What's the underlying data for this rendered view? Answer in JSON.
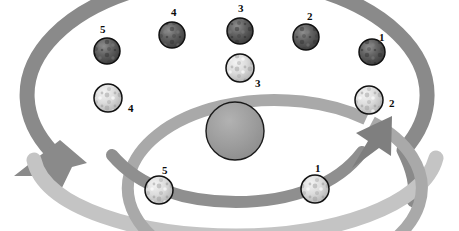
{
  "figure": {
    "title": "",
    "top_cropped_text": "",
    "center_body": {
      "name": "planet",
      "fill": "#9a9a9a",
      "stroke": "#1a1a1a"
    }
  },
  "palette": {
    "outer_arrow": "#8a8a8a",
    "inner_arrow": "#a9a9a9",
    "lower_pale_arc": "#c4c4c4",
    "dark_moon_fill": "#5d5d5d",
    "light_moon_fill": "#d8d8d8",
    "moon_stroke": "#111111",
    "label_color": "#0b0b0b",
    "background": "#ffffff"
  },
  "orbits": [
    {
      "id": "outer-orbit",
      "name": "outer-orbit-arrow",
      "direction": "counterclockwise",
      "arrowhead": "lower-left",
      "color": "#8a8a8a",
      "moon_style": "dark"
    },
    {
      "id": "inner-orbit",
      "name": "inner-orbit-arrow",
      "direction": "clockwise",
      "arrowhead": "upper-right",
      "color": "#a9a9a9",
      "moon_style": "light"
    }
  ],
  "outer_moons": [
    {
      "label": "5",
      "cx": 107,
      "cy": 51,
      "r": 13,
      "label_x": 100,
      "label_y": 24
    },
    {
      "label": "4",
      "cx": 172,
      "cy": 35,
      "r": 13,
      "label_x": 171,
      "label_y": 7
    },
    {
      "label": "3",
      "cx": 240,
      "cy": 31,
      "r": 13,
      "label_x": 238,
      "label_y": 3
    },
    {
      "label": "2",
      "cx": 306,
      "cy": 37,
      "r": 13,
      "label_x": 307,
      "label_y": 11
    },
    {
      "label": "1",
      "cx": 372,
      "cy": 52,
      "r": 13,
      "label_x": 379,
      "label_y": 32
    }
  ],
  "inner_moons": [
    {
      "label": "4",
      "cx": 108,
      "cy": 98,
      "r": 14,
      "label_x": 128,
      "label_y": 103
    },
    {
      "label": "3",
      "cx": 240,
      "cy": 68,
      "r": 14,
      "label_x": 255,
      "label_y": 78
    },
    {
      "label": "2",
      "cx": 369,
      "cy": 100,
      "r": 14,
      "label_x": 389,
      "label_y": 98
    },
    {
      "label": "5",
      "cx": 159,
      "cy": 190,
      "r": 14,
      "label_x": 162,
      "label_y": 165
    },
    {
      "label": "1",
      "cx": 315,
      "cy": 189,
      "r": 14,
      "label_x": 315,
      "label_y": 163
    }
  ]
}
